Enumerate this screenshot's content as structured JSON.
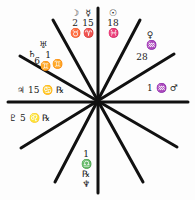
{
  "chart": {
    "type": "astrological-house-wheel",
    "line_color": "#111111",
    "background": "#fdfdfd",
    "center": [
      98,
      101
    ],
    "spokes": [
      [
        8,
        102,
        188,
        102
      ],
      [
        98,
        8,
        98,
        193
      ],
      [
        53,
        20,
        143,
        182
      ],
      [
        20,
        56,
        177,
        147
      ],
      [
        140,
        20,
        55,
        182
      ],
      [
        174,
        54,
        21,
        148
      ]
    ]
  },
  "labels": {
    "moon": {
      "glyph": "☽",
      "degree": "2",
      "sign": "♉"
    },
    "mercury": {
      "glyph": "☿",
      "degree": "15",
      "sign": "♈"
    },
    "sun": {
      "glyph": "☉",
      "degree": "18",
      "sign": "♓"
    },
    "venus": {
      "glyph": "♀",
      "sign": "♒",
      "degree": "28"
    },
    "uranus": {
      "glyph": "♅",
      "degree": "1",
      "sign": "♊"
    },
    "saturn": {
      "glyph": "♄",
      "degree": "6",
      "sign": "♊"
    },
    "jupiter": {
      "text": "♃ 15 ♋ ℞"
    },
    "pluto": {
      "text": "♇ 5 ♌ ℞"
    },
    "mars": {
      "text": "1 ♒ ♂"
    },
    "neptune": {
      "degree": "1",
      "sign": "♎",
      "retro": "℞",
      "glyph": "♆"
    }
  }
}
